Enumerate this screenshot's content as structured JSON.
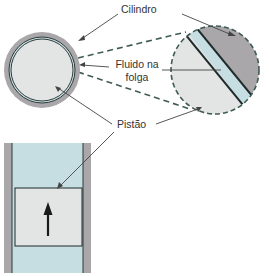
{
  "diagram": {
    "labels": {
      "cylinder": "Cilindro",
      "fluid_line1": "Fluido na",
      "fluid_line2": "folga",
      "piston": "Pistão"
    },
    "colors": {
      "cylinder": "#a9a7a9",
      "fluid": "#c6dee1",
      "piston": "#e3e4e4",
      "outline": "#1f2a2a",
      "dashed": "#3f5b55",
      "leader": "#444444"
    }
  }
}
